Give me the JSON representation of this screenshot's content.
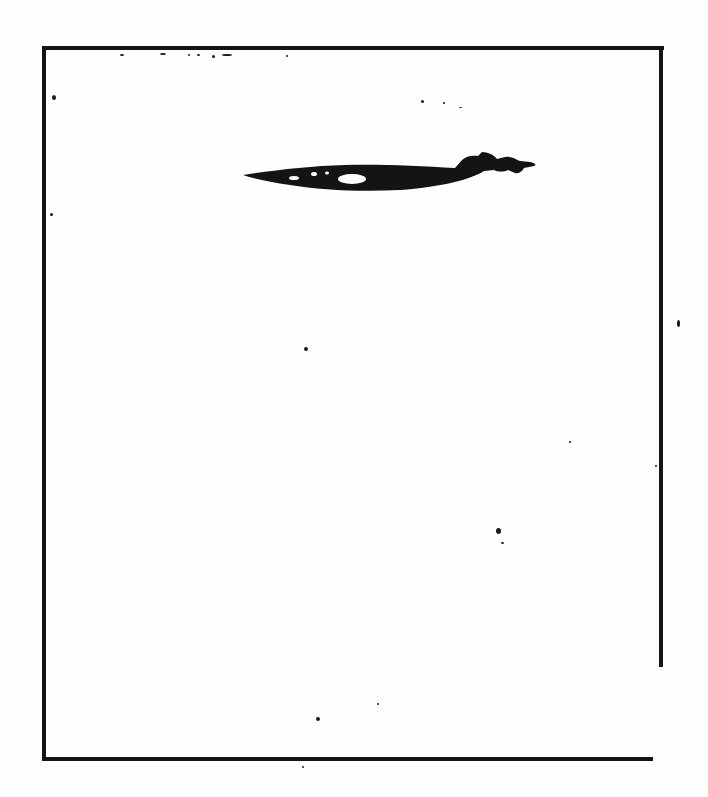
{
  "document": {
    "type": "scanned-figure",
    "text": [],
    "colors": {
      "ink": "#141414",
      "paper": "#fefefe"
    }
  },
  "frame": {
    "top": {
      "x1": 42,
      "x2": 664,
      "y": 48,
      "thickness": 4
    },
    "left": {
      "x": 42,
      "y1": 46,
      "y2": 760,
      "thickness": 4
    },
    "right": {
      "x": 660,
      "y1": 50,
      "y2": 667,
      "thickness": 4
    },
    "bottom": {
      "x1": 42,
      "x2": 653,
      "y": 758,
      "thickness": 4
    }
  },
  "specks": [
    {
      "x": 120,
      "y": 54,
      "w": 4,
      "h": 2
    },
    {
      "x": 160,
      "y": 53,
      "w": 6,
      "h": 2
    },
    {
      "x": 188,
      "y": 54,
      "w": 2,
      "h": 2
    },
    {
      "x": 197,
      "y": 54,
      "w": 3,
      "h": 2
    },
    {
      "x": 212,
      "y": 55,
      "w": 3,
      "h": 3
    },
    {
      "x": 222,
      "y": 54,
      "w": 10,
      "h": 2
    },
    {
      "x": 286,
      "y": 55,
      "w": 2,
      "h": 2
    },
    {
      "x": 52,
      "y": 95,
      "w": 4,
      "h": 5
    },
    {
      "x": 421,
      "y": 100,
      "w": 3,
      "h": 3
    },
    {
      "x": 443,
      "y": 102,
      "w": 2,
      "h": 2
    },
    {
      "x": 459,
      "y": 107,
      "w": 3,
      "h": 1
    },
    {
      "x": 50,
      "y": 213,
      "w": 3,
      "h": 3
    },
    {
      "x": 677,
      "y": 320,
      "w": 3,
      "h": 7
    },
    {
      "x": 304,
      "y": 347,
      "w": 4,
      "h": 4
    },
    {
      "x": 569,
      "y": 441,
      "w": 2,
      "h": 2
    },
    {
      "x": 655,
      "y": 465,
      "w": 2,
      "h": 2
    },
    {
      "x": 496,
      "y": 528,
      "w": 5,
      "h": 6
    },
    {
      "x": 501,
      "y": 542,
      "w": 3,
      "h": 2
    },
    {
      "x": 316,
      "y": 717,
      "w": 4,
      "h": 4
    },
    {
      "x": 377,
      "y": 703,
      "w": 2,
      "h": 2
    },
    {
      "x": 302,
      "y": 766,
      "w": 2,
      "h": 2
    }
  ]
}
